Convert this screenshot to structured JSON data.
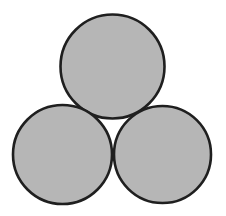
{
  "figure": {
    "background_color": "#ffffff",
    "fill_color": "#b6b6b6",
    "stroke_color": "#1f1f1f",
    "stroke_width": 2.6,
    "width": 226,
    "height": 216,
    "circles": [
      {
        "name": "top-circle",
        "cx": 112.5,
        "cy": 66.5,
        "r": 52.0
      },
      {
        "name": "bottom-left-circle",
        "cx": 62.5,
        "cy": 154.5,
        "r": 49.5
      },
      {
        "name": "bottom-right-circle",
        "cx": 162.5,
        "cy": 154.5,
        "r": 48.5
      }
    ]
  }
}
